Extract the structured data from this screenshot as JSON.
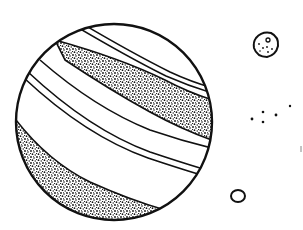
{
  "illustration": {
    "title": "Banded planet with moons",
    "style": "black-and-white stippled line drawing",
    "colors": {
      "ink": "#111111",
      "paper": "#ffffff"
    },
    "planet": {
      "cx": 114,
      "cy": 122,
      "r": 98,
      "bands": [
        {
          "name": "upper-stippled-band",
          "stippled": true
        },
        {
          "name": "middle-double-stripes",
          "stippled": false
        },
        {
          "name": "lower-stippled-band",
          "stippled": true
        }
      ]
    },
    "moon": {
      "cx": 266,
      "cy": 45,
      "r": 12,
      "craters": 6
    },
    "ring": {
      "cx": 238,
      "cy": 196,
      "rx": 7,
      "ry": 6
    },
    "dots": [
      {
        "x": 252,
        "y": 119
      },
      {
        "x": 263,
        "y": 112
      },
      {
        "x": 263,
        "y": 122
      },
      {
        "x": 276,
        "y": 115
      },
      {
        "x": 290,
        "y": 106
      }
    ]
  }
}
